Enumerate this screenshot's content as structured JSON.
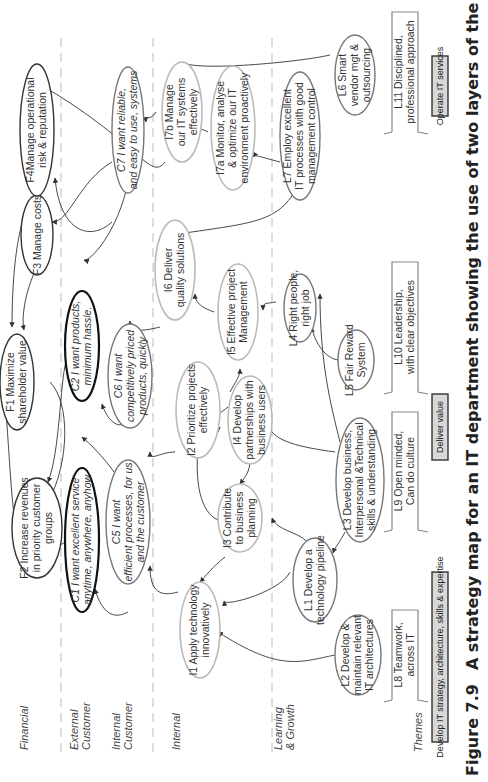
{
  "caption": {
    "figure_number": "Figure 7.9",
    "text": "A strategy map for an IT department showing the use of two layers of the customer perspective"
  },
  "lanes": [
    {
      "id": "financial",
      "label_lines": [
        "Financial"
      ]
    },
    {
      "id": "external_customer",
      "label_lines": [
        "External",
        "Customer"
      ]
    },
    {
      "id": "internal_customer",
      "label_lines": [
        "Internal",
        "Customer"
      ]
    },
    {
      "id": "internal",
      "label_lines": [
        "Internal"
      ]
    },
    {
      "id": "learning_growth",
      "label_lines": [
        "Learning",
        "& Growth"
      ]
    },
    {
      "id": "themes",
      "label_lines": [
        "Themes"
      ]
    }
  ],
  "nodes": {
    "F1": {
      "lines": [
        "F1 Maximize",
        "shareholder value"
      ]
    },
    "F2": {
      "lines": [
        "F2 Increase revenues",
        "in priority customer",
        "groups"
      ]
    },
    "F3": {
      "lines": [
        "F3 Manage costs"
      ]
    },
    "F4": {
      "lines": [
        "F4Manage operational",
        "risk & reputation"
      ]
    },
    "C1": {
      "lines": [
        "C1 I want excellent service",
        "anytime, anywhere, anyhow"
      ]
    },
    "C2": {
      "lines": [
        "C2 I want products,",
        "minimum hassle."
      ]
    },
    "C5": {
      "lines": [
        "C5 I want",
        "efficient processes, for us",
        "and the customer"
      ]
    },
    "C6": {
      "lines": [
        "C6 I want",
        "competitively priced",
        "products, quickly"
      ]
    },
    "C7": {
      "lines": [
        "C7 I want reliable,",
        "and easy to use, systems"
      ]
    },
    "I1": {
      "lines": [
        "I1 Apply technology",
        "innovatively"
      ]
    },
    "I2": {
      "lines": [
        "I2 Prioritize projects",
        "effectively"
      ]
    },
    "I3": {
      "lines": [
        "I3 Contribute",
        "to business",
        "planning"
      ]
    },
    "I4": {
      "lines": [
        "I4 Develop",
        "partnerships with",
        "business users"
      ]
    },
    "I5": {
      "lines": [
        "I5 Effective project",
        "Management"
      ]
    },
    "I6": {
      "lines": [
        "I6 Deliver",
        "quality solutions"
      ]
    },
    "I7a": {
      "lines": [
        "I7a Monitor, analyse",
        "& optimize our IT",
        "environment proactively"
      ]
    },
    "I7b": {
      "lines": [
        "I7b Manage",
        "our IT systems",
        "effectively"
      ]
    },
    "L1": {
      "lines": [
        "L1 Develop a",
        "technology pipeline"
      ]
    },
    "L2": {
      "lines": [
        "L2 Develop &",
        "maintain relevant",
        "IT architectures"
      ]
    },
    "L3": {
      "lines": [
        "L3 Develop business,",
        "Interpersonal &Technical",
        "skills & understanding"
      ]
    },
    "L4": {
      "lines": [
        "L4 Right people,",
        "right job"
      ]
    },
    "L5": {
      "lines": [
        "L5 Fair Reward",
        "System"
      ]
    },
    "L6": {
      "lines": [
        "L6 Smart",
        "vendor mgt &",
        "outsourcing"
      ]
    },
    "L7": {
      "lines": [
        "L7 Employ excellent",
        "IT processes with good",
        "management control"
      ]
    }
  },
  "culture": {
    "L8": {
      "lines": [
        "L8 Teamwork,",
        "across IT"
      ]
    },
    "L9": {
      "lines": [
        "L9 Open minded,",
        "Can do culture"
      ]
    },
    "L10": {
      "lines": [
        "L10 Leadership,",
        "with clear objectives"
      ]
    },
    "L11": {
      "lines": [
        "L11 Disciplined,",
        "professional approach"
      ]
    }
  },
  "themes": [
    {
      "label": "Develop IT strategy, architecture, skills & expertise"
    },
    {
      "label": "Deliver value"
    },
    {
      "label": "Operate IT services"
    }
  ],
  "edges": [
    [
      "F2",
      "F1"
    ],
    [
      "F3",
      "F1"
    ],
    [
      "F4",
      "F1"
    ],
    [
      "F1",
      "F2"
    ],
    [
      "C1",
      "F2"
    ],
    [
      "C7",
      "F4"
    ],
    [
      "C7",
      "F3"
    ],
    [
      "C7",
      "C2"
    ],
    [
      "C5",
      "C1"
    ],
    [
      "C5",
      "C2"
    ],
    [
      "C6",
      "C2"
    ],
    [
      "C2",
      "F2"
    ],
    [
      "I1",
      "C5"
    ],
    [
      "I2",
      "C6"
    ],
    [
      "I6",
      "C6"
    ],
    [
      "I7b",
      "C7"
    ],
    [
      "I7b",
      "F4"
    ],
    [
      "I3",
      "I1"
    ],
    [
      "I3",
      "I2"
    ],
    [
      "I4",
      "I2"
    ],
    [
      "I4",
      "I3"
    ],
    [
      "I4",
      "I5"
    ],
    [
      "I5",
      "I6"
    ],
    [
      "I7a",
      "I7b"
    ],
    [
      "L1",
      "I1"
    ],
    [
      "L1",
      "I3"
    ],
    [
      "L2",
      "I1"
    ],
    [
      "L3",
      "L1"
    ],
    [
      "L3",
      "I4"
    ],
    [
      "L3",
      "L4"
    ],
    [
      "L4",
      "I5"
    ],
    [
      "L5",
      "L4"
    ],
    [
      "L6",
      "I7b"
    ],
    [
      "L7",
      "I7a"
    ],
    [
      "L7",
      "I6"
    ]
  ]
}
